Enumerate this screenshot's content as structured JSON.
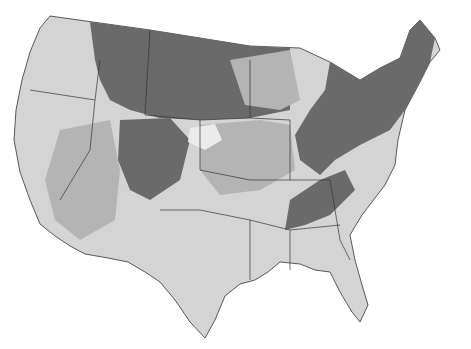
{
  "map": {
    "type": "choropleth",
    "region": "contiguous United States",
    "labels": [],
    "legend": null,
    "shades": {
      "darkest": "#6a6a6a",
      "dark": "#8e8e8e",
      "medium": "#b4b4b4",
      "light": "#d4d4d4",
      "lightest": "#e8e8e8",
      "background": "#ffffff",
      "border": "#333333"
    }
  }
}
